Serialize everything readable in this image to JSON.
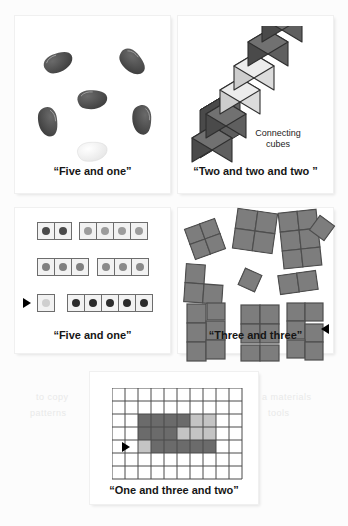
{
  "figure": {
    "panels": [
      {
        "id": "beans-panel",
        "caption": "“Five and one”",
        "manipulative": "lima beans",
        "decomposition": [
          5,
          1
        ],
        "total": 6,
        "items": [
          {
            "name": "bean",
            "color": "#4e4e4e",
            "x": 26,
            "y": 35,
            "rot": -28
          },
          {
            "name": "bean",
            "color": "#4e4e4e",
            "x": 100,
            "y": 36,
            "rot": 35
          },
          {
            "name": "bean",
            "color": "#4e4e4e",
            "x": 64,
            "y": 75,
            "rot": -10
          },
          {
            "name": "bean",
            "color": "#4e4e4e",
            "x": 20,
            "y": 100,
            "rot": 72
          },
          {
            "name": "bean",
            "color": "#4e4e4e",
            "x": 112,
            "y": 98,
            "rot": 80
          },
          {
            "name": "bean",
            "color": "#f2f2f2",
            "x": 62,
            "y": 128,
            "rot": -14
          }
        ]
      },
      {
        "id": "cubes-panel",
        "caption": "“Two and two and two ”",
        "sublabel": "Connecting\ncubes",
        "sublabel_line1": "Connecting",
        "sublabel_line2": "cubes",
        "manipulative": "connecting cubes",
        "decomposition": [
          2,
          2,
          2
        ],
        "total": 6,
        "cube_colors": [
          "#5d5d5d",
          "#5d5d5d",
          "#d6d6d6",
          "#d6d6d6",
          "#5d5d5d",
          "#5d5d5d"
        ]
      },
      {
        "id": "dot-cards-panel",
        "caption": "“Five and one”",
        "manipulative": "dot cards",
        "marked_row": 3,
        "marker": "right-arrow",
        "rows": [
          {
            "index": 1,
            "groups": [
              2,
              4
            ],
            "dot_colors": [
              "#4a4a4a",
              "#9c9c9c"
            ],
            "card_bg": "#f2f2f2"
          },
          {
            "index": 2,
            "groups": [
              3,
              3
            ],
            "dot_colors": [
              "#808080",
              "#8a8a8a"
            ],
            "card_bg": "#f2f2f2"
          },
          {
            "index": 3,
            "groups": [
              1,
              5
            ],
            "dot_colors": [
              "#cfcfcf",
              "#2b2b2b"
            ],
            "card_bg": "#f2f2f2"
          }
        ]
      },
      {
        "id": "tiles-panel",
        "caption": "“Three and three”",
        "manipulative": "square tiles",
        "decomposition": [
          3,
          3
        ],
        "total": 6,
        "marker": "left-arrow",
        "tile_color": "#7d7d7d",
        "clusters": [
          {
            "shape": "square-2x2",
            "x": 16,
            "y": 18,
            "rot": -20
          },
          {
            "shape": "square-2x2",
            "x": 62,
            "y": 4,
            "rot": 8
          },
          {
            "shape": "L-tromino",
            "x": 106,
            "y": 6,
            "rot": -6
          },
          {
            "shape": "single",
            "x": 140,
            "y": 12,
            "rot": 35
          },
          {
            "shape": "L-tromino",
            "x": 8,
            "y": 56,
            "rot": 4
          },
          {
            "shape": "single",
            "x": 66,
            "y": 64,
            "rot": 22
          },
          {
            "shape": "domino",
            "x": 104,
            "y": 66,
            "rot": -8
          },
          {
            "shape": "P-pentomino",
            "x": 10,
            "y": 96,
            "rot": 0
          },
          {
            "shape": "square-2x2-plus",
            "x": 62,
            "y": 96,
            "rot": 0
          },
          {
            "shape": "S-shape",
            "x": 110,
            "y": 94,
            "rot": 0
          }
        ]
      },
      {
        "id": "grid-panel",
        "caption": "“One and three and two”",
        "manipulative": "grid paper",
        "decomposition": [
          1,
          3,
          2
        ],
        "total": 6,
        "marker": "right-arrow",
        "marked_row": 5,
        "grid": {
          "cols": 10,
          "rows": 7,
          "cell": 13,
          "line_color": "#4a4a4a"
        },
        "shaded_cells": [
          {
            "row": 3,
            "col": 2,
            "color": "#6b6b6b"
          },
          {
            "row": 3,
            "col": 3,
            "color": "#6b6b6b"
          },
          {
            "row": 3,
            "col": 4,
            "color": "#6b6b6b"
          },
          {
            "row": 3,
            "col": 5,
            "color": "#6b6b6b"
          },
          {
            "row": 3,
            "col": 6,
            "color": "#c4c4c4"
          },
          {
            "row": 3,
            "col": 7,
            "color": "#c4c4c4"
          },
          {
            "row": 4,
            "col": 2,
            "color": "#6b6b6b"
          },
          {
            "row": 4,
            "col": 3,
            "color": "#6b6b6b"
          },
          {
            "row": 4,
            "col": 4,
            "color": "#6b6b6b"
          },
          {
            "row": 4,
            "col": 5,
            "color": "#c4c4c4"
          },
          {
            "row": 4,
            "col": 6,
            "color": "#c4c4c4"
          },
          {
            "row": 4,
            "col": 7,
            "color": "#c4c4c4"
          },
          {
            "row": 5,
            "col": 2,
            "color": "#c4c4c4"
          },
          {
            "row": 5,
            "col": 3,
            "color": "#6b6b6b"
          },
          {
            "row": 5,
            "col": 4,
            "color": "#6b6b6b"
          },
          {
            "row": 5,
            "col": 5,
            "color": "#6b6b6b"
          },
          {
            "row": 5,
            "col": 6,
            "color": "#6b6b6b"
          },
          {
            "row": 5,
            "col": 7,
            "color": "#6b6b6b"
          }
        ]
      }
    ],
    "colors": {
      "bean_dark": "#4e4e4e",
      "bean_light": "#f2f2f2",
      "cube_dark": "#5d5d5d",
      "cube_light": "#d6d6d6",
      "tile_gray": "#7d7d7d",
      "grid_dark": "#6b6b6b",
      "grid_light": "#c4c4c4",
      "panel_bg": "#ffffff",
      "page_bg": "#fcfcfc",
      "text": "#161616"
    },
    "bleed_text": [
      "to copy",
      "patterns",
      "a materials",
      "tools"
    ]
  }
}
